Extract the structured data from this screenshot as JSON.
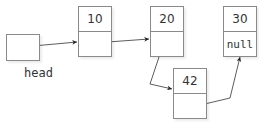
{
  "diagram": {
    "head": {
      "label": "head"
    },
    "nodes": [
      {
        "value": "10",
        "next": ""
      },
      {
        "value": "20",
        "next": ""
      },
      {
        "value": "30",
        "next": "null"
      },
      {
        "value": "42",
        "next": ""
      }
    ],
    "colors": {
      "stroke": "#8a8a8a",
      "arrow": "#333333",
      "text": "#333333"
    }
  }
}
